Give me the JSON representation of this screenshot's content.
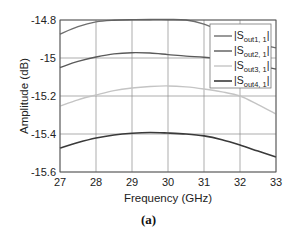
{
  "figure": {
    "caption": "(a)"
  },
  "chart_data": {
    "type": "line",
    "title": "",
    "xlabel": "Frequency (GHz)",
    "ylabel": "Amplitude (dB)",
    "xlim": [
      27,
      33
    ],
    "ylim": [
      -15.6,
      -14.8
    ],
    "xticks": [
      27,
      28,
      29,
      30,
      31,
      32,
      33
    ],
    "xtick_labels": [
      "27",
      "28",
      "29",
      "30",
      "31",
      "32",
      "33"
    ],
    "yticks": [
      -14.8,
      -15.0,
      -15.2,
      -15.4,
      -15.6
    ],
    "ytick_labels": [
      "-14.8",
      "-15",
      "-15.2",
      "-15.4",
      "-15.6"
    ],
    "grid": true,
    "legend_position": "upper right",
    "x": [
      27,
      27.5,
      28,
      28.5,
      29,
      29.5,
      30,
      30.5,
      31,
      31.5,
      32,
      32.5,
      33
    ],
    "series": [
      {
        "name": "|S_out1,1|",
        "label_main": "|S",
        "label_sub": "out1, 1",
        "label_end": "|",
        "color": "#6e6e6e",
        "width": 1.4,
        "values": [
          -14.874,
          -14.835,
          -14.81,
          -14.801,
          -14.798,
          -14.797,
          -14.797,
          -14.8,
          -14.822,
          -14.86,
          -14.895,
          -14.925,
          -14.947
        ]
      },
      {
        "name": "|S_out2,1|",
        "label_main": "|S",
        "label_sub": "out2, 1",
        "label_end": "|",
        "color": "#5a5a5a",
        "width": 1.4,
        "values": [
          -15.05,
          -15.018,
          -14.995,
          -14.978,
          -14.972,
          -14.974,
          -14.982,
          -14.99,
          -14.996,
          -15.005,
          -15.02,
          -15.04,
          -15.058
        ]
      },
      {
        "name": "|S_out3,1|",
        "label_main": "|S",
        "label_sub": "out3, 1",
        "label_end": "|",
        "color": "#c4c4c4",
        "width": 1.4,
        "values": [
          -15.253,
          -15.22,
          -15.195,
          -15.172,
          -15.158,
          -15.15,
          -15.147,
          -15.152,
          -15.163,
          -15.178,
          -15.2,
          -15.245,
          -15.295
        ]
      },
      {
        "name": "|S_out4,1|",
        "label_main": "|S",
        "label_sub": "out4, 1",
        "label_end": "|",
        "color": "#3a3a3a",
        "width": 1.6,
        "values": [
          -15.474,
          -15.445,
          -15.421,
          -15.405,
          -15.396,
          -15.392,
          -15.395,
          -15.4,
          -15.41,
          -15.43,
          -15.458,
          -15.49,
          -15.521
        ]
      }
    ]
  }
}
